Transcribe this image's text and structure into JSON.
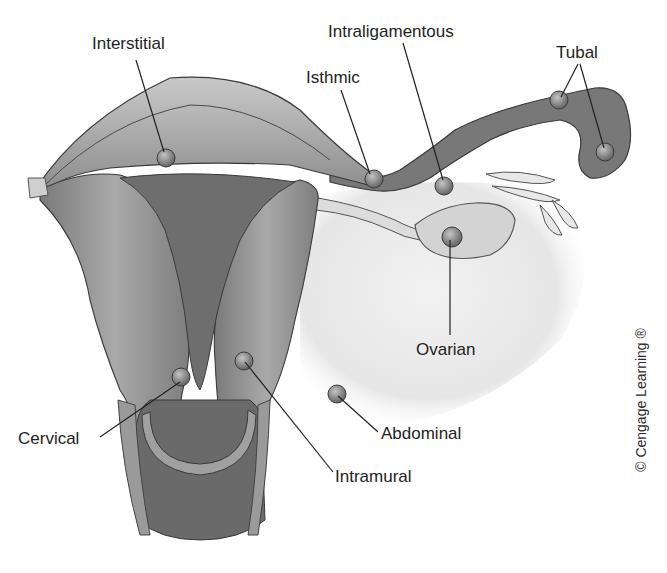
{
  "figure": {
    "copyright": "© Cengage Learning ®"
  },
  "labels": {
    "interstitial": "Interstitial",
    "intraligamentous": "Intraligamentous",
    "isthmic": "Isthmic",
    "tubal": "Tubal",
    "ovarian": "Ovarian",
    "cervical": "Cervical",
    "abdominal": "Abdominal",
    "intramural": "Intramural"
  },
  "colors": {
    "tissue_light": "#b8b8b8",
    "tissue_mid": "#8c8c8c",
    "tissue_dark": "#5f5f5f",
    "cavity": "#6e6e6e",
    "outline": "#3a3a3a",
    "ligament": "#ececec",
    "leader_line": "#222222",
    "text": "#1e1e1e"
  }
}
